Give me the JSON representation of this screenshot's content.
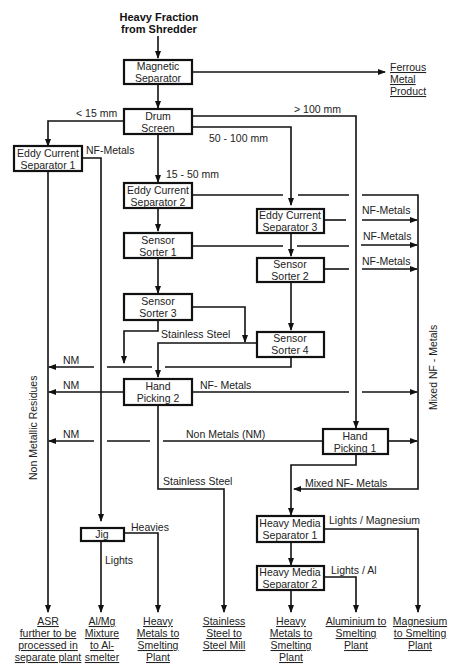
{
  "title": {
    "line1": "Heavy Fraction",
    "line2": "from Shredder"
  },
  "boxes": {
    "magnetic": [
      "Magnetic",
      "Separator"
    ],
    "drum": [
      "Drum",
      "Screen"
    ],
    "ecs1": [
      "Eddy Current",
      "Separator 1"
    ],
    "ecs2": [
      "Eddy Current",
      "Separator 2"
    ],
    "ecs3": [
      "Eddy Current",
      "Separator 3"
    ],
    "ss1": [
      "Sensor",
      "Sorter 1"
    ],
    "ss2": [
      "Sensor",
      "Sorter 2"
    ],
    "ss3": [
      "Sensor",
      "Sorter 3"
    ],
    "ss4": [
      "Sensor",
      "Sorter 4"
    ],
    "hp2": [
      "Hand",
      "Picking 2"
    ],
    "hp1": [
      "Hand",
      "Picking 1"
    ],
    "jig": [
      "Jig"
    ],
    "hms1": [
      "Heavy Media",
      "Separator 1"
    ],
    "hms2": [
      "Heavy Media",
      "Separator 2"
    ]
  },
  "labels": {
    "lt15": "< 15 mm",
    "gt100": "> 100 mm",
    "r50_100": "50 - 100 mm",
    "r15_50": "15 - 50 mm",
    "nf_metals_1": "NF-Metals",
    "nf_metals_ecs3": "NF-Metals",
    "nf_metals_ss1": "NF-Metals",
    "nf_metals_ss2": "NF-Metals",
    "stainless_steel_1": "Stainless Steel",
    "nm_1": "NM",
    "nm_2": "NM",
    "nm_3": "NM",
    "nf_metals_hp2": "NF- Metals",
    "non_metals": "Non Metals (NM)",
    "stainless_steel_2": "Stainless Steel",
    "mixed_nf_metals": "Mixed NF- Metals",
    "heavies": "Heavies",
    "lights": "Lights",
    "lights_magnesium": "Lights / Magnesium",
    "lights_al": "Lights / Al",
    "non_metallic_residues": "Non Metallic Residues",
    "mixed_nf_metals_vertical": "Mixed NF - Metals"
  },
  "outputs": {
    "ferrous": [
      "Ferrous",
      "Metal",
      "Product"
    ],
    "asr": [
      "ASR",
      "further to be",
      "processed in",
      "separate plant"
    ],
    "almg": [
      "Al/Mg",
      "Mixture",
      "to Al-",
      "smelter"
    ],
    "heavy1": [
      "Heavy",
      "Metals to",
      "Smelting",
      "Plant"
    ],
    "stainless": [
      "Stainless",
      "Steel to",
      "Steel Mill"
    ],
    "heavy2": [
      "Heavy",
      "Metals to",
      "Smelting",
      "Plant"
    ],
    "aluminium": [
      "Aluminium to",
      "Smelting",
      "Plant"
    ],
    "magnesium": [
      "Magnesium",
      "to Smelting",
      "Plant"
    ]
  }
}
